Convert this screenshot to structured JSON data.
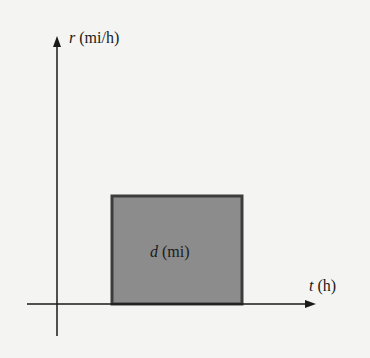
{
  "diagram": {
    "y_axis": {
      "variable": "r",
      "unit": "(mi/h)"
    },
    "x_axis": {
      "variable": "t",
      "unit": "(h)"
    },
    "region": {
      "variable": "d",
      "unit": "(mi)"
    },
    "colors": {
      "background": "#f4f4f2",
      "axis": "#1a1a1a",
      "region_fill": "#8c8c8c",
      "region_border": "#3c3c3c"
    }
  }
}
